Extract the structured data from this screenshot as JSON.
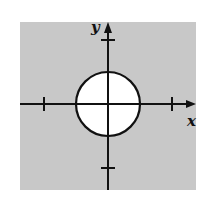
{
  "chart_data": {
    "type": "region",
    "title": "",
    "xlabel": "x",
    "ylabel": "y",
    "xlim": [
      -1.35,
      1.35
    ],
    "ylim": [
      -1.35,
      1.35
    ],
    "x_ticks": [
      -1,
      1
    ],
    "y_ticks": [
      -1,
      1
    ],
    "tick_labels_shown": false,
    "grid": false,
    "legend": null,
    "circle": {
      "center": [
        0,
        0
      ],
      "radius": 0.5,
      "interior": "unshaded",
      "boundary": "solid"
    },
    "shaded_region": "outside the circle",
    "colors": {
      "shade": "#c8c8c8",
      "interior": "#ffffff",
      "ink": "#111111"
    }
  }
}
